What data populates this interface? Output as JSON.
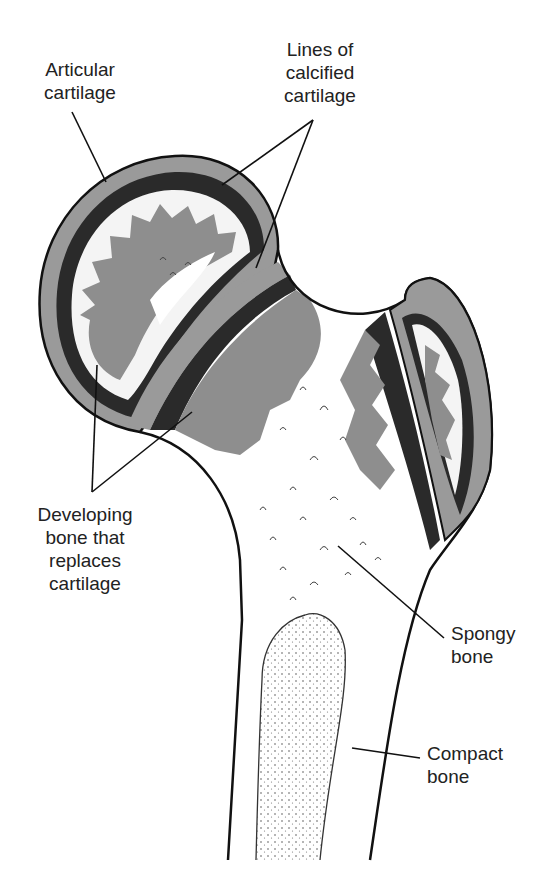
{
  "figure": {
    "colors": {
      "outline": "#111111",
      "cartilage": "#9a9a9a",
      "calcified_line": "#2a2a2a",
      "developing_bone": "#8e8e8e",
      "background": "#ffffff"
    }
  },
  "labels": {
    "articular_cartilage": "Articular\ncartilage",
    "lines_calcified": "Lines of\ncalcified\ncartilage",
    "developing_bone": "Developing\nbone that\nreplaces\ncartilage",
    "spongy_bone": "Spongy\nbone",
    "compact_bone": "Compact\nbone"
  }
}
